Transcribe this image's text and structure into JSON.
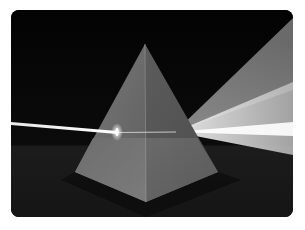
{
  "image": {
    "subject": "pyramid prism refracting a beam of light",
    "alt": "A light beam enters a four-sided glass pyramid and spreads out into a wide fan of light on the other side",
    "colors": {
      "background": "#050505",
      "floor": "#1e1e1e",
      "pyramid_left_face": "#6a6a6a",
      "pyramid_right_face": "#5a5a5a",
      "pyramid_lower_left": "#737373",
      "pyramid_lower_right": "#666666",
      "beam": "#f4f4f4",
      "spectrum_fan": "#d8d8d8"
    }
  }
}
